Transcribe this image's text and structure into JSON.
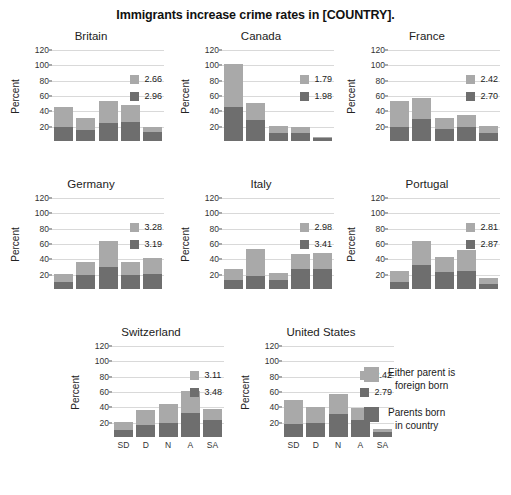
{
  "chart_data": {
    "type": "bar",
    "title": "Immigrants increase crime rates in [COUNTRY].",
    "subplot_layout": "3 rows x 3 columns (last row has 2 panels plus legend)",
    "stacked": true,
    "categories": [
      "SD",
      "D",
      "N",
      "A",
      "SA"
    ],
    "xlabel": "",
    "ylabel": "Percent",
    "ylim": [
      0,
      120
    ],
    "yticks": [
      20,
      40,
      60,
      80,
      100,
      120
    ],
    "grid": true,
    "legend_position": "bottom-right",
    "series": [
      {
        "name": "Either parent is foreign born",
        "color": "#a9a9a9"
      },
      {
        "name": "Parents born in country",
        "color": "#6e6e6e"
      }
    ],
    "panels": [
      {
        "name": "Britain",
        "means": {
          "foreign_born": "2.66",
          "born_in_country": "2.96"
        },
        "dark_values": [
          20,
          16,
          25,
          26,
          13
        ],
        "light_values": [
          26,
          15,
          29,
          22,
          6
        ],
        "totals": [
          46,
          31,
          54,
          48,
          19
        ]
      },
      {
        "name": "Canada",
        "means": {
          "foreign_born": "1.79",
          "born_in_country": "1.98"
        },
        "dark_values": [
          46,
          29,
          12,
          12,
          5
        ],
        "light_values": [
          56,
          22,
          9,
          8,
          1
        ],
        "totals": [
          102,
          51,
          21,
          20,
          6
        ]
      },
      {
        "name": "France",
        "means": {
          "foreign_born": "2.42",
          "born_in_country": "2.70"
        },
        "dark_values": [
          20,
          30,
          17,
          19,
          12
        ],
        "light_values": [
          33,
          28,
          14,
          16,
          9
        ],
        "totals": [
          53,
          58,
          31,
          35,
          21
        ]
      },
      {
        "name": "Germany",
        "means": {
          "foreign_born": "3.28",
          "born_in_country": "3.19"
        },
        "dark_values": [
          11,
          20,
          30,
          19,
          21
        ],
        "light_values": [
          10,
          16,
          34,
          17,
          21
        ],
        "totals": [
          21,
          36,
          64,
          36,
          42
        ]
      },
      {
        "name": "Italy",
        "means": {
          "foreign_born": "2.98",
          "born_in_country": "3.41"
        },
        "dark_values": [
          13,
          18,
          13,
          27,
          28
        ],
        "light_values": [
          14,
          35,
          9,
          20,
          20
        ],
        "totals": [
          27,
          53,
          22,
          47,
          48
        ]
      },
      {
        "name": "Portugal",
        "means": {
          "foreign_born": "2.81",
          "born_in_country": "2.87"
        },
        "dark_values": [
          11,
          32,
          23,
          25,
          8
        ],
        "light_values": [
          14,
          32,
          20,
          27,
          8
        ],
        "totals": [
          25,
          64,
          43,
          52,
          16
        ]
      },
      {
        "name": "Switzerland",
        "means": {
          "foreign_born": "3.11",
          "born_in_country": "3.48"
        },
        "dark_values": [
          10,
          17,
          19,
          33,
          24
        ],
        "light_values": [
          11,
          19,
          25,
          28,
          14
        ],
        "totals": [
          21,
          36,
          44,
          61,
          38
        ]
      },
      {
        "name": "United States",
        "means": {
          "foreign_born": "2.42",
          "born_in_country": "2.79"
        },
        "dark_values": [
          18,
          20,
          31,
          24,
          8
        ],
        "light_values": [
          32,
          21,
          27,
          15,
          4
        ],
        "totals": [
          50,
          41,
          58,
          39,
          12
        ]
      }
    ]
  },
  "legend": {
    "light": {
      "line1": "Either parent is",
      "line2": "foreign born",
      "color": "#a9a9a9"
    },
    "dark": {
      "line1": "Parents born",
      "line2": "in country",
      "color": "#6e6e6e"
    }
  }
}
